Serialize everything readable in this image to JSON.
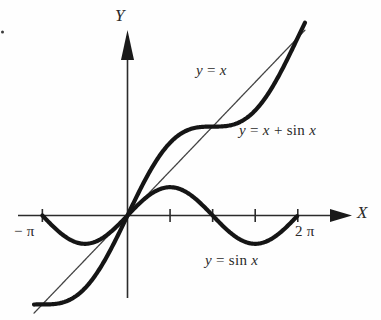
{
  "figure": {
    "background_color": "#fefefe",
    "ink_color": "#151515"
  },
  "axes": {
    "x_axis_label": "X",
    "y_axis_label": "Y",
    "x_ticks": [
      {
        "label": "− π",
        "value": -3.14159,
        "show_label": true
      },
      {
        "label": "",
        "value": 1.5708,
        "show_label": false
      },
      {
        "label": "",
        "value": 3.14159,
        "show_label": false
      },
      {
        "label": "",
        "value": 4.71239,
        "show_label": false
      },
      {
        "label": "2 π",
        "value": 6.28319,
        "show_label": true
      }
    ],
    "x_range": [
      -3.6,
      7.6
    ],
    "y_range": [
      -4.3,
      4.6
    ],
    "grid": false,
    "origin_marked": true
  },
  "curves": [
    {
      "name": "y-equals-x",
      "label": "y = x",
      "label_parts": {
        "lhs": "y",
        "op": "=",
        "rhs": "x"
      },
      "type": "line",
      "weight": "thin",
      "color": "#444444",
      "domain": [
        -3.45,
        6.55
      ]
    },
    {
      "name": "y-equals-sin-x",
      "label": "y = sin x",
      "label_parts": {
        "lhs": "y",
        "op": "=",
        "fn": "sin",
        "rhs": "x"
      },
      "type": "sine",
      "weight": "thick",
      "color": "#151515",
      "amplitude": 1,
      "domain": [
        -3.14159,
        6.28319
      ]
    },
    {
      "name": "y-equals-x-plus-sin-x",
      "label": "y = x + sin x",
      "label_parts": {
        "lhs": "y",
        "op": "=",
        "rhs": "x",
        "plus": "+",
        "fn": "sin",
        "arg": "x"
      },
      "type": "x-plus-sine",
      "weight": "thick",
      "color": "#151515",
      "domain": [
        -3.45,
        6.55
      ]
    }
  ],
  "chart_data": {
    "type": "line",
    "xlabel": "X",
    "ylabel": "Y",
    "xlim": [
      -3.6,
      7.6
    ],
    "ylim": [
      -4.3,
      4.6
    ],
    "grid": false,
    "legend": "inline-annotations",
    "xticks": [
      -3.14159,
      1.5708,
      3.14159,
      4.71239,
      6.28319
    ],
    "xticklabels": [
      "− π",
      "",
      "",
      "",
      "2 π"
    ],
    "x": [
      -3.14159,
      -2.61799,
      -2.0944,
      -1.5708,
      -1.0472,
      -0.5236,
      0,
      0.5236,
      1.0472,
      1.5708,
      2.0944,
      2.61799,
      3.14159,
      3.66519,
      4.18879,
      4.71239,
      5.23599,
      5.75959,
      6.28319
    ],
    "series": [
      {
        "name": "y = x",
        "values": [
          -3.14159,
          -2.61799,
          -2.0944,
          -1.5708,
          -1.0472,
          -0.5236,
          0,
          0.5236,
          1.0472,
          1.5708,
          2.0944,
          2.61799,
          3.14159,
          3.66519,
          4.18879,
          4.71239,
          5.23599,
          5.75959,
          6.28319
        ]
      },
      {
        "name": "y = sin x",
        "values": [
          0,
          -0.5,
          -0.866,
          -1,
          -0.866,
          -0.5,
          0,
          0.5,
          0.866,
          1,
          0.866,
          0.5,
          0,
          -0.5,
          -0.866,
          -1,
          -0.866,
          -0.5,
          0
        ]
      },
      {
        "name": "y = x + sin x",
        "values": [
          -3.14159,
          -3.11799,
          -2.9604,
          -2.5708,
          -1.9132,
          -1.0236,
          0,
          1.0236,
          1.9132,
          2.5708,
          2.9604,
          3.11799,
          3.14159,
          3.16519,
          3.32279,
          3.71239,
          4.36999,
          5.25959,
          6.28319
        ]
      }
    ],
    "annotations": [
      {
        "text": "y = x",
        "x": 2.0,
        "y": 3.6
      },
      {
        "text": "y = x + sin x",
        "x": 4.0,
        "y": 2.2
      },
      {
        "text": "y = sin x",
        "x": 2.6,
        "y": -1.9
      }
    ]
  },
  "artifacts": {
    "speck": {
      "x": 2,
      "y": 32,
      "size": 3
    }
  }
}
